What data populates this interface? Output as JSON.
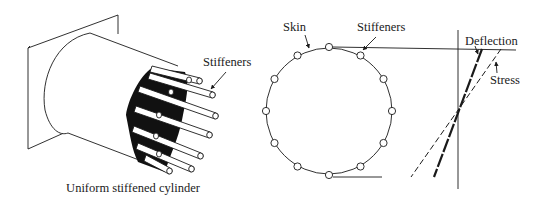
{
  "left_figure": {
    "stiffeners_label": "Stiffeners",
    "caption": "Uniform stiffened cylinder"
  },
  "cross_section": {
    "skin_label": "Skin",
    "stiffeners_label": "Stiffeners",
    "stiffener_count": 12
  },
  "distribution_plot": {
    "deflection_label": "Deflection",
    "stress_label": "Stress"
  },
  "colors": {
    "line": "#1a1a1a",
    "background": "#ffffff"
  }
}
